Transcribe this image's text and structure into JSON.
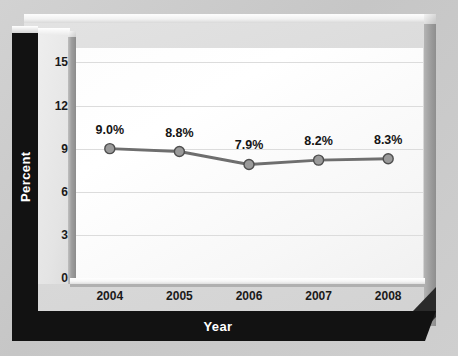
{
  "chart_data": {
    "type": "line",
    "title": "",
    "xlabel": "Year",
    "ylabel": "Percent",
    "categories": [
      "2004",
      "2005",
      "2006",
      "2007",
      "2008"
    ],
    "values": [
      9.0,
      8.8,
      7.9,
      8.2,
      8.3
    ],
    "point_labels": [
      "9.0%",
      "8.8%",
      "7.9%",
      "8.2%",
      "8.3%"
    ],
    "yticks": [
      15,
      12,
      9,
      6,
      3,
      0
    ],
    "ytick_labels": [
      "15",
      "12",
      "9",
      "6",
      "3",
      "0"
    ],
    "ylim": [
      0,
      16
    ],
    "xlim_categories": 5,
    "grid": true,
    "legend": false,
    "series": [
      {
        "name": "Percent",
        "values": [
          9.0,
          8.8,
          7.9,
          8.2,
          8.3
        ]
      }
    ],
    "colors": {
      "line": "#6e6e6e",
      "marker_fill": "#9a9a9a",
      "marker_stroke": "#4e4e4e",
      "plot_background": "#fbfbfb",
      "gridline": "#dcdcdc",
      "axis_bar": "#121212",
      "axis_bar_text": "#ffffff",
      "tick_text": "#1a1a1a",
      "panel": "#dcdcdc",
      "page_background": "#cccccc"
    }
  },
  "axes": {
    "y_title": "Percent",
    "x_title": "Year"
  }
}
